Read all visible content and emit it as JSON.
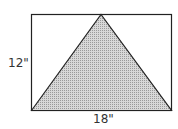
{
  "diagram": {
    "height_label": "12\"",
    "width_label": "18\"",
    "fill_color": "#b8b8b8",
    "stroke_color": "#222222"
  }
}
